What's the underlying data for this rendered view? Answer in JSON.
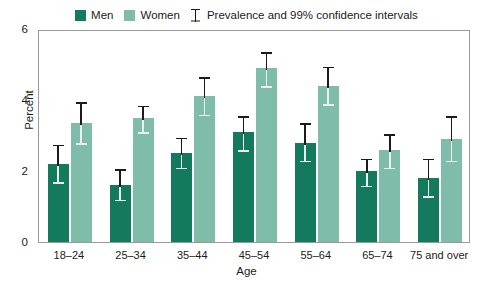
{
  "legend": {
    "men_label": "Men",
    "women_label": "Women",
    "ci_note": "Prevalence and 99% confidence intervals",
    "men_color": "#137a5e",
    "women_color": "#7fbdaa",
    "ci_icon": "error-bar-icon"
  },
  "axis": {
    "ylabel": "Percent",
    "xlabel": "Age",
    "yticks": [
      "0",
      "2",
      "4",
      "6"
    ]
  },
  "chart_data": {
    "type": "bar",
    "title": "",
    "subtitle": "",
    "xlabel": "Age",
    "ylabel": "Percent",
    "ylim": [
      0,
      6
    ],
    "yticks": [
      0,
      2,
      4,
      6
    ],
    "grid": false,
    "legend_position": "top-center",
    "annotations": [
      "Prevalence and 99% confidence intervals"
    ],
    "categories": [
      "18–24",
      "25–34",
      "35–44",
      "45–54",
      "55–64",
      "65–74",
      "75 and over"
    ],
    "series": [
      {
        "name": "Men",
        "color": "#137a5e",
        "values": [
          2.2,
          1.6,
          2.5,
          3.1,
          2.8,
          2.0,
          1.8
        ],
        "ci_low": [
          1.7,
          1.2,
          2.1,
          2.6,
          2.3,
          1.6,
          1.3
        ],
        "ci_high": [
          2.8,
          2.1,
          3.0,
          3.6,
          3.4,
          2.4,
          2.4
        ]
      },
      {
        "name": "Women",
        "color": "#7fbdaa",
        "values": [
          3.35,
          3.5,
          4.1,
          4.9,
          4.4,
          2.6,
          2.9
        ],
        "ci_low": [
          2.8,
          3.1,
          3.6,
          4.4,
          3.9,
          2.1,
          2.3
        ],
        "ci_high": [
          4.0,
          3.9,
          4.7,
          5.4,
          5.0,
          3.1,
          3.6
        ]
      }
    ]
  }
}
